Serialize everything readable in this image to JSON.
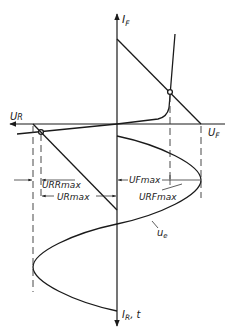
{
  "diagram": {
    "colors": {
      "line": "#1a1a1a",
      "background": "#ffffff"
    },
    "axes": {
      "vertical_up_label": {
        "main": "I",
        "sub": "F"
      },
      "vertical_down_label": {
        "main": "I",
        "sub": "R",
        "suffix": ", t"
      },
      "horizontal_left_label": {
        "main": "U",
        "sub": "R"
      },
      "horizontal_right_label": {
        "main": "U",
        "sub": "F"
      }
    },
    "dimensions": {
      "urr_max": {
        "main": "U",
        "sub": "RRmax"
      },
      "ur_max": {
        "main": "U",
        "sub": "Rmax"
      },
      "uf_max": {
        "main": "U",
        "sub": "Fmax"
      },
      "urf_max": {
        "main": "U",
        "sub": "RFmax"
      }
    },
    "curves": {
      "input_voltage": {
        "main": "u",
        "sub": "e"
      }
    }
  }
}
